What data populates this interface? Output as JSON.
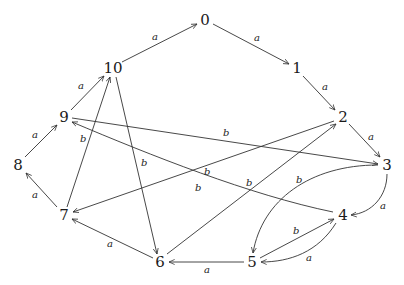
{
  "diagram": {
    "type": "directed-graph",
    "nodes": [
      {
        "id": "0",
        "label": "0",
        "x": 205,
        "y": 20
      },
      {
        "id": "1",
        "label": "1",
        "x": 297,
        "y": 68
      },
      {
        "id": "2",
        "label": "2",
        "x": 343,
        "y": 117
      },
      {
        "id": "3",
        "label": "3",
        "x": 387,
        "y": 165
      },
      {
        "id": "4",
        "label": "4",
        "x": 343,
        "y": 215
      },
      {
        "id": "5",
        "label": "5",
        "x": 252,
        "y": 262
      },
      {
        "id": "6",
        "label": "6",
        "x": 160,
        "y": 262
      },
      {
        "id": "7",
        "label": "7",
        "x": 64,
        "y": 215
      },
      {
        "id": "8",
        "label": "8",
        "x": 18,
        "y": 165
      },
      {
        "id": "9",
        "label": "9",
        "x": 64,
        "y": 117
      },
      {
        "id": "10",
        "label": "10",
        "x": 113,
        "y": 68
      }
    ],
    "edges": [
      {
        "from": "10",
        "to": "0",
        "label": "a",
        "curved": false
      },
      {
        "from": "0",
        "to": "1",
        "label": "a",
        "curved": false
      },
      {
        "from": "1",
        "to": "2",
        "label": "a",
        "curved": false
      },
      {
        "from": "2",
        "to": "3",
        "label": "a",
        "curved": false
      },
      {
        "from": "3",
        "to": "4",
        "label": "a",
        "curved": true
      },
      {
        "from": "4",
        "to": "5",
        "label": "a",
        "curved": true
      },
      {
        "from": "5",
        "to": "6",
        "label": "a",
        "curved": false
      },
      {
        "from": "6",
        "to": "7",
        "label": "a",
        "curved": false
      },
      {
        "from": "7",
        "to": "8",
        "label": "a",
        "curved": false
      },
      {
        "from": "8",
        "to": "9",
        "label": "a",
        "curved": false
      },
      {
        "from": "9",
        "to": "10",
        "label": "a",
        "curved": false
      },
      {
        "from": "9",
        "to": "3",
        "label": "b",
        "curved": false
      },
      {
        "from": "4",
        "to": "9",
        "label": "b",
        "curved": true
      },
      {
        "from": "2",
        "to": "7",
        "label": "b",
        "curved": false
      },
      {
        "from": "6",
        "to": "2",
        "label": "b",
        "curved": false
      },
      {
        "from": "10",
        "to": "6",
        "label": "b",
        "curved": false
      },
      {
        "from": "7",
        "to": "10",
        "label": "b",
        "curved": false
      },
      {
        "from": "3",
        "to": "5",
        "label": "b",
        "curved": true
      },
      {
        "from": "5",
        "to": "4",
        "label": "b",
        "curved": false
      }
    ],
    "labels": {
      "n0": "0",
      "n1": "1",
      "n2": "2",
      "n3": "3",
      "n4": "4",
      "n5": "5",
      "n6": "6",
      "n7": "7",
      "n8": "8",
      "n9": "9",
      "n10": "10",
      "a": "a",
      "b": "b"
    }
  }
}
